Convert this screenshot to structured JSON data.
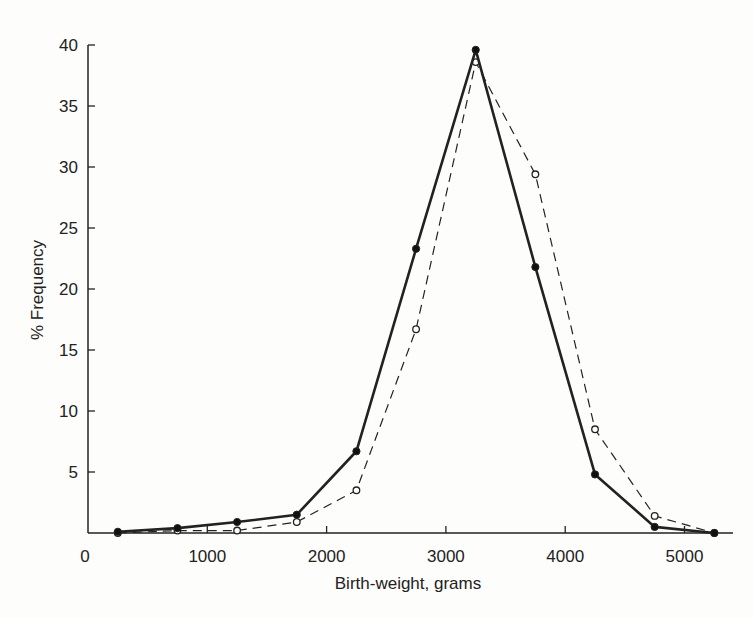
{
  "chart_data": {
    "type": "line",
    "title": "",
    "xlabel": "Birth-weight, grams",
    "ylabel": "% Frequency",
    "xlim": [
      0,
      5300
    ],
    "ylim": [
      0,
      40
    ],
    "x_ticks": [
      0,
      1000,
      2000,
      3000,
      4000,
      5000
    ],
    "y_ticks": [
      5,
      10,
      15,
      20,
      25,
      30,
      35,
      40
    ],
    "y_tick_labels": [
      "5",
      "10",
      "15",
      "20",
      "25",
      "30",
      "35",
      "40"
    ],
    "x_tick_labels": [
      "0",
      "1000",
      "2000",
      "3000",
      "4000",
      "5000"
    ],
    "y_zero_label": "0",
    "grid": false,
    "legend": null,
    "x": [
      250,
      750,
      1250,
      1750,
      2250,
      2750,
      3250,
      3750,
      4250,
      4750,
      5250
    ],
    "series": [
      {
        "name": "solid line, filled markers",
        "style": "solid",
        "marker": "filled-circle",
        "values": [
          0.1,
          0.4,
          0.9,
          1.5,
          6.7,
          23.3,
          39.6,
          21.8,
          4.8,
          0.5,
          0.0
        ]
      },
      {
        "name": "dashed line, open markers",
        "style": "dashed",
        "marker": "open-circle",
        "values": [
          0.0,
          0.2,
          0.2,
          0.9,
          3.5,
          16.7,
          38.6,
          29.4,
          8.5,
          1.4,
          0.0
        ]
      }
    ]
  }
}
